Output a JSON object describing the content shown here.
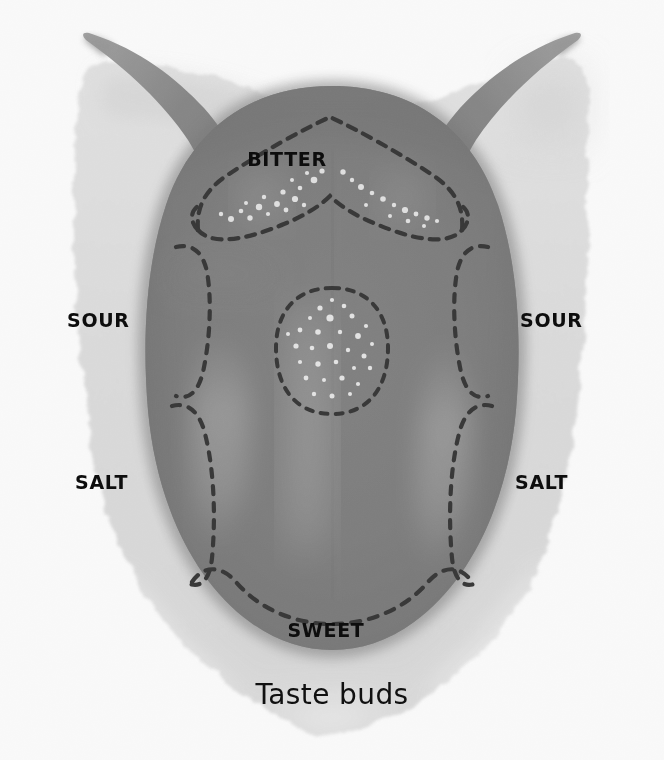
{
  "figure": {
    "kind": "anatomical-illustration",
    "caption": "Taste buds",
    "style": "grayscale halftone print illustration with dashed zone boundaries",
    "colors": {
      "page_background": "#ffffff",
      "painted_background": "#dcdcdc",
      "tongue_mid": "#737373",
      "tongue_shadow": "#5a5a5a",
      "tongue_highlight": "#a8a8a8",
      "dash_line": "#262626",
      "papillae_dot": "#e8e8e8",
      "label_text": "#0d0d0d"
    },
    "zone_labels": [
      {
        "id": "bitter",
        "text": "BITTER",
        "position": "top-center, on tongue root"
      },
      {
        "id": "sour-left",
        "text": "SOUR",
        "position": "left margin, upper"
      },
      {
        "id": "sour-right",
        "text": "SOUR",
        "position": "right margin, upper"
      },
      {
        "id": "salt-left",
        "text": "SALT",
        "position": "left margin, lower"
      },
      {
        "id": "salt-right",
        "text": "SALT",
        "position": "right margin, lower"
      },
      {
        "id": "sweet",
        "text": "SWEET",
        "position": "bottom-center, on tongue tip"
      }
    ],
    "regions": [
      {
        "name": "bitter-band",
        "description": "chevron / V-shaped dashed band across the tongue root containing white taste-bud dots"
      },
      {
        "name": "sour-band",
        "description": "dashed strips along the upper lateral borders of the tongue"
      },
      {
        "name": "salt-band",
        "description": "dashed strips along the lower lateral borders of the tongue"
      },
      {
        "name": "sweet-band",
        "description": "dashed arc across the tongue tip"
      },
      {
        "name": "central-oval",
        "description": "dashed oval at the tongue centre speckled with white papillae"
      },
      {
        "name": "median-sulcus",
        "description": "faint vertical midline groove running down the tongue"
      }
    ]
  }
}
